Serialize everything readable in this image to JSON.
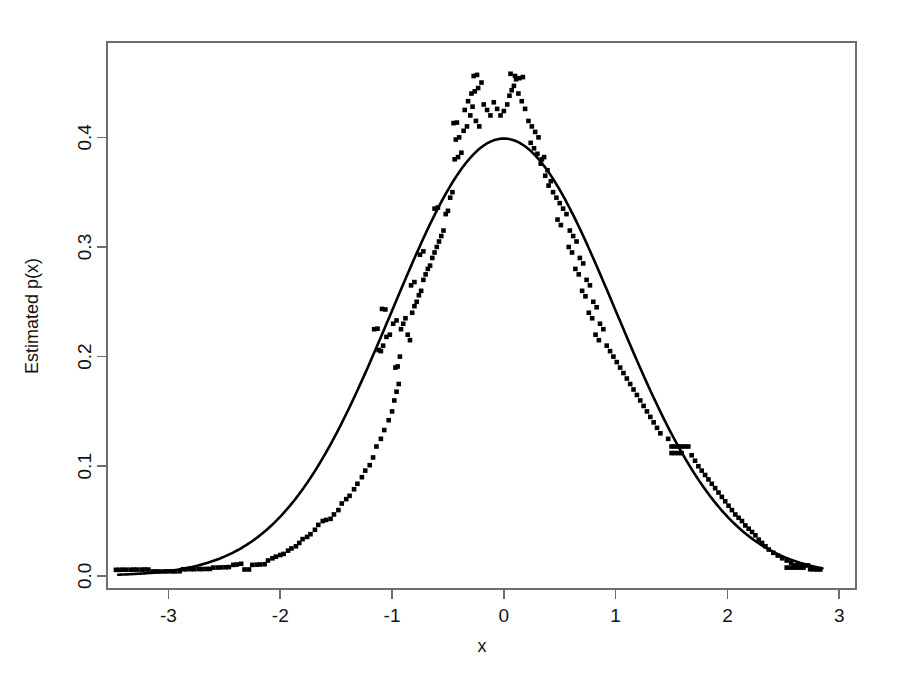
{
  "chart_data": {
    "type": "scatter",
    "title": "",
    "subtitle": "",
    "xlabel": "x",
    "ylabel": "Estimated p(x)",
    "xlim": [
      -3.55,
      3.15
    ],
    "ylim": [
      -0.012,
      0.487
    ],
    "xticks": [
      -3,
      -2,
      -1,
      0,
      1,
      2,
      3
    ],
    "xticklabels": [
      "-3",
      "-2",
      "-1",
      "0",
      "1",
      "2",
      "3"
    ],
    "yticks": [
      0.0,
      0.1,
      0.2,
      0.3,
      0.4
    ],
    "yticklabels": [
      "0.0",
      "0.1",
      "0.2",
      "0.3",
      "0.4"
    ],
    "grid": false,
    "legend": "none",
    "box": "full-rectangle",
    "series": [
      {
        "name": "Estimated density points",
        "type": "scatter",
        "marker": "small filled square",
        "color": "#000000",
        "points": [
          [
            -3.47,
            0.0055
          ],
          [
            -3.44,
            0.0055
          ],
          [
            -3.41,
            0.0056
          ],
          [
            -3.38,
            0.0056
          ],
          [
            -3.34,
            0.0056
          ],
          [
            -3.31,
            0.0057
          ],
          [
            -3.28,
            0.0057
          ],
          [
            -3.24,
            0.0057
          ],
          [
            -3.21,
            0.0058
          ],
          [
            -3.18,
            0.0057
          ],
          [
            -3.14,
            0.004
          ],
          [
            -3.11,
            0.004
          ],
          [
            -3.08,
            0.004
          ],
          [
            -3.04,
            0.004
          ],
          [
            -3.01,
            0.0041
          ],
          [
            -2.97,
            0.0041
          ],
          [
            -2.94,
            0.0041
          ],
          [
            -2.9,
            0.0042
          ],
          [
            -2.87,
            0.006
          ],
          [
            -2.84,
            0.006
          ],
          [
            -2.8,
            0.0061
          ],
          [
            -2.77,
            0.0061
          ],
          [
            -2.73,
            0.0062
          ],
          [
            -2.7,
            0.0062
          ],
          [
            -2.66,
            0.0063
          ],
          [
            -2.63,
            0.0063
          ],
          [
            -2.6,
            0.0075
          ],
          [
            -2.56,
            0.0076
          ],
          [
            -2.53,
            0.0077
          ],
          [
            -2.49,
            0.0078
          ],
          [
            -2.46,
            0.008
          ],
          [
            -2.42,
            0.01
          ],
          [
            -2.39,
            0.0103
          ],
          [
            -2.35,
            0.011
          ],
          [
            -2.32,
            0.0058
          ],
          [
            -2.28,
            0.0058
          ],
          [
            -2.25,
            0.01
          ],
          [
            -2.21,
            0.0102
          ],
          [
            -2.18,
            0.0104
          ],
          [
            -2.14,
            0.0106
          ],
          [
            -2.11,
            0.014
          ],
          [
            -2.07,
            0.016
          ],
          [
            -2.04,
            0.0175
          ],
          [
            -2.0,
            0.019
          ],
          [
            -1.97,
            0.02
          ],
          [
            -1.93,
            0.023
          ],
          [
            -1.9,
            0.025
          ],
          [
            -1.86,
            0.027
          ],
          [
            -1.83,
            0.03
          ],
          [
            -1.8,
            0.0335
          ],
          [
            -1.76,
            0.0355
          ],
          [
            -1.73,
            0.038
          ],
          [
            -1.69,
            0.042
          ],
          [
            -1.66,
            0.0465
          ],
          [
            -1.62,
            0.05
          ],
          [
            -1.59,
            0.051
          ],
          [
            -1.55,
            0.052
          ],
          [
            -1.52,
            0.056
          ],
          [
            -1.48,
            0.06
          ],
          [
            -1.45,
            0.066
          ],
          [
            -1.41,
            0.07
          ],
          [
            -1.38,
            0.073
          ],
          [
            -1.34,
            0.079
          ],
          [
            -1.31,
            0.084
          ],
          [
            -1.27,
            0.09
          ],
          [
            -1.24,
            0.096
          ],
          [
            -1.2,
            0.101
          ],
          [
            -1.17,
            0.108
          ],
          [
            -1.14,
            0.118
          ],
          [
            -1.1,
            0.125
          ],
          [
            -1.07,
            0.133
          ],
          [
            -1.03,
            0.142
          ],
          [
            -1.0,
            0.15
          ],
          [
            -0.98,
            0.16
          ],
          [
            -0.96,
            0.168
          ],
          [
            -0.94,
            0.175
          ],
          [
            -0.97,
            0.19
          ],
          [
            -0.95,
            0.191
          ],
          [
            -0.93,
            0.2
          ],
          [
            -1.1,
            0.205
          ],
          [
            -1.12,
            0.206
          ],
          [
            -1.08,
            0.21
          ],
          [
            -1.05,
            0.218
          ],
          [
            -1.02,
            0.22
          ],
          [
            -1.16,
            0.225
          ],
          [
            -1.13,
            0.2255
          ],
          [
            -0.99,
            0.23
          ],
          [
            -0.96,
            0.233
          ],
          [
            -1.06,
            0.243
          ],
          [
            -1.09,
            0.2435
          ],
          [
            -0.92,
            0.225
          ],
          [
            -0.9,
            0.23
          ],
          [
            -0.88,
            0.235
          ],
          [
            -0.86,
            0.22
          ],
          [
            -0.84,
            0.215
          ],
          [
            -0.82,
            0.24
          ],
          [
            -0.8,
            0.246
          ],
          [
            -0.78,
            0.25
          ],
          [
            -0.76,
            0.256
          ],
          [
            -0.74,
            0.26
          ],
          [
            -0.83,
            0.265
          ],
          [
            -0.8,
            0.268
          ],
          [
            -0.72,
            0.27
          ],
          [
            -0.7,
            0.275
          ],
          [
            -0.68,
            0.28
          ],
          [
            -0.66,
            0.283
          ],
          [
            -0.64,
            0.29
          ],
          [
            -0.62,
            0.295
          ],
          [
            -0.75,
            0.293
          ],
          [
            -0.72,
            0.296
          ],
          [
            -0.6,
            0.3
          ],
          [
            -0.58,
            0.305
          ],
          [
            -0.56,
            0.31
          ],
          [
            -0.54,
            0.315
          ],
          [
            -0.52,
            0.33
          ],
          [
            -0.5,
            0.333
          ],
          [
            -0.62,
            0.335
          ],
          [
            -0.59,
            0.336
          ],
          [
            -0.48,
            0.345
          ],
          [
            -0.46,
            0.35
          ],
          [
            -0.44,
            0.38
          ],
          [
            -0.41,
            0.382
          ],
          [
            -0.38,
            0.386
          ],
          [
            -0.43,
            0.398
          ],
          [
            -0.4,
            0.4
          ],
          [
            -0.36,
            0.406
          ],
          [
            -0.33,
            0.41
          ],
          [
            -0.45,
            0.413
          ],
          [
            -0.42,
            0.4135
          ],
          [
            -0.3,
            0.42
          ],
          [
            -0.35,
            0.425
          ],
          [
            -0.28,
            0.428
          ],
          [
            -0.25,
            0.415
          ],
          [
            -0.22,
            0.41
          ],
          [
            -0.32,
            0.433
          ],
          [
            -0.29,
            0.44
          ],
          [
            -0.26,
            0.442
          ],
          [
            -0.23,
            0.445
          ],
          [
            -0.2,
            0.45
          ],
          [
            -0.27,
            0.456
          ],
          [
            -0.24,
            0.457
          ],
          [
            -0.18,
            0.43
          ],
          [
            -0.15,
            0.425
          ],
          [
            -0.12,
            0.42
          ],
          [
            -0.09,
            0.432
          ],
          [
            -0.06,
            0.426
          ],
          [
            -0.03,
            0.42
          ],
          [
            0.0,
            0.424
          ],
          [
            0.03,
            0.43
          ],
          [
            0.05,
            0.438
          ],
          [
            0.07,
            0.443
          ],
          [
            0.09,
            0.447
          ],
          [
            0.11,
            0.453
          ],
          [
            0.06,
            0.458
          ],
          [
            0.1,
            0.456
          ],
          [
            0.13,
            0.44
          ],
          [
            0.16,
            0.433
          ],
          [
            0.19,
            0.426
          ],
          [
            0.14,
            0.454
          ],
          [
            0.17,
            0.455
          ],
          [
            0.22,
            0.415
          ],
          [
            0.25,
            0.41
          ],
          [
            0.28,
            0.405
          ],
          [
            0.31,
            0.4
          ],
          [
            0.24,
            0.395
          ],
          [
            0.27,
            0.39
          ],
          [
            0.3,
            0.385
          ],
          [
            0.34,
            0.38
          ],
          [
            0.36,
            0.382
          ],
          [
            0.33,
            0.376
          ],
          [
            0.39,
            0.37
          ],
          [
            0.37,
            0.365
          ],
          [
            0.42,
            0.36
          ],
          [
            0.4,
            0.356
          ],
          [
            0.44,
            0.35
          ],
          [
            0.47,
            0.345
          ],
          [
            0.5,
            0.34
          ],
          [
            0.53,
            0.335
          ],
          [
            0.56,
            0.33
          ],
          [
            0.48,
            0.325
          ],
          [
            0.51,
            0.32
          ],
          [
            0.59,
            0.315
          ],
          [
            0.62,
            0.31
          ],
          [
            0.65,
            0.305
          ],
          [
            0.58,
            0.3
          ],
          [
            0.61,
            0.295
          ],
          [
            0.68,
            0.29
          ],
          [
            0.71,
            0.285
          ],
          [
            0.64,
            0.28
          ],
          [
            0.67,
            0.275
          ],
          [
            0.74,
            0.27
          ],
          [
            0.77,
            0.265
          ],
          [
            0.7,
            0.26
          ],
          [
            0.73,
            0.255
          ],
          [
            0.8,
            0.25
          ],
          [
            0.83,
            0.245
          ],
          [
            0.76,
            0.24
          ],
          [
            0.79,
            0.235
          ],
          [
            0.86,
            0.23
          ],
          [
            0.89,
            0.225
          ],
          [
            0.82,
            0.22
          ],
          [
            0.85,
            0.215
          ],
          [
            0.92,
            0.21
          ],
          [
            0.95,
            0.205
          ],
          [
            0.98,
            0.2
          ],
          [
            1.01,
            0.195
          ],
          [
            1.04,
            0.19
          ],
          [
            1.07,
            0.185
          ],
          [
            1.1,
            0.18
          ],
          [
            1.13,
            0.175
          ],
          [
            1.16,
            0.17
          ],
          [
            1.19,
            0.165
          ],
          [
            1.22,
            0.16
          ],
          [
            1.25,
            0.155
          ],
          [
            1.28,
            0.15
          ],
          [
            1.31,
            0.145
          ],
          [
            1.34,
            0.14
          ],
          [
            1.37,
            0.135
          ],
          [
            1.4,
            0.13
          ],
          [
            1.47,
            0.125
          ],
          [
            1.5,
            0.118
          ],
          [
            1.53,
            0.118
          ],
          [
            1.56,
            0.118
          ],
          [
            1.59,
            0.118
          ],
          [
            1.62,
            0.118
          ],
          [
            1.65,
            0.118
          ],
          [
            1.5,
            0.112
          ],
          [
            1.53,
            0.112
          ],
          [
            1.56,
            0.112
          ],
          [
            1.59,
            0.112
          ],
          [
            1.68,
            0.11
          ],
          [
            1.71,
            0.105
          ],
          [
            1.74,
            0.1
          ],
          [
            1.77,
            0.096
          ],
          [
            1.8,
            0.092
          ],
          [
            1.83,
            0.088
          ],
          [
            1.86,
            0.084
          ],
          [
            1.89,
            0.08
          ],
          [
            1.92,
            0.076
          ],
          [
            1.95,
            0.072
          ],
          [
            1.98,
            0.068
          ],
          [
            2.01,
            0.064
          ],
          [
            2.04,
            0.06
          ],
          [
            2.07,
            0.056
          ],
          [
            2.1,
            0.053
          ],
          [
            2.13,
            0.05
          ],
          [
            2.16,
            0.046
          ],
          [
            2.19,
            0.043
          ],
          [
            2.22,
            0.04
          ],
          [
            2.25,
            0.037
          ],
          [
            2.28,
            0.033
          ],
          [
            2.31,
            0.03
          ],
          [
            2.34,
            0.027
          ],
          [
            2.37,
            0.024
          ],
          [
            2.41,
            0.021
          ],
          [
            2.45,
            0.0185
          ],
          [
            2.49,
            0.016
          ],
          [
            2.53,
            0.014
          ],
          [
            2.57,
            0.012
          ],
          [
            2.6,
            0.0095
          ],
          [
            2.63,
            0.0095
          ],
          [
            2.66,
            0.0095
          ],
          [
            2.69,
            0.0095
          ],
          [
            2.72,
            0.0095
          ],
          [
            2.53,
            0.0075
          ],
          [
            2.56,
            0.0075
          ],
          [
            2.59,
            0.0075
          ],
          [
            2.62,
            0.0075
          ],
          [
            2.65,
            0.0075
          ],
          [
            2.68,
            0.0075
          ],
          [
            2.74,
            0.006
          ],
          [
            2.77,
            0.006
          ],
          [
            2.8,
            0.0058
          ],
          [
            2.83,
            0.0058
          ]
        ]
      },
      {
        "name": "Fitted normal density",
        "type": "line",
        "color": "#000000",
        "formula": "standard normal pdf: (1/sqrt(2*pi)) * exp(-x^2/2)",
        "peak": [
          0.0,
          0.3989
        ],
        "x_range": [
          -3.45,
          2.85
        ],
        "sampled_points": [
          [
            -3.45,
            0.0011
          ],
          [
            -3.0,
            0.0044
          ],
          [
            -2.5,
            0.0175
          ],
          [
            -2.0,
            0.054
          ],
          [
            -1.5,
            0.1295
          ],
          [
            -1.0,
            0.242
          ],
          [
            -0.5,
            0.3521
          ],
          [
            0.0,
            0.3989
          ],
          [
            0.5,
            0.3521
          ],
          [
            1.0,
            0.242
          ],
          [
            1.5,
            0.1295
          ],
          [
            2.0,
            0.054
          ],
          [
            2.5,
            0.0175
          ],
          [
            2.85,
            0.0069
          ]
        ]
      }
    ]
  },
  "figure": {
    "background_color": "#ffffff",
    "axis_color": "#6e6e6e",
    "data_color": "#000000"
  }
}
